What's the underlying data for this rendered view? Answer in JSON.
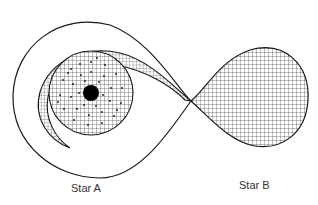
{
  "diagram": {
    "labels": {
      "star_a": "Star A",
      "star_b": "Star B"
    },
    "colors": {
      "line": "#1a1a1a",
      "background": "#ffffff",
      "hatch": "#333333",
      "compact_object": "#000000"
    },
    "elements": [
      {
        "name": "star-a-roche-lobe",
        "description": "Outer Roche lobe boundary around Star A"
      },
      {
        "name": "star-b-roche-lobe",
        "description": "Cross-hatched Roche lobe filled by Star B"
      },
      {
        "name": "accretion-stream",
        "description": "Cross-hatched stream flowing from inner Lagrange point into Star A's disk"
      },
      {
        "name": "accretion-disk",
        "description": "Cross-hatched, dotted swirling disk around Star A"
      },
      {
        "name": "compact-object",
        "description": "Black central dot (Star A)"
      }
    ]
  }
}
